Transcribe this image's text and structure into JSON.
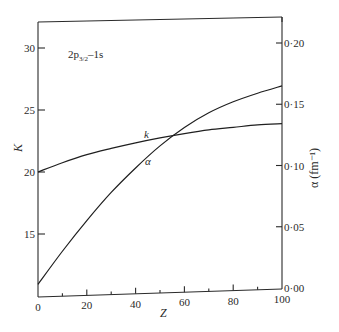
{
  "chart_data": {
    "type": "line",
    "title": "",
    "annotation": "2p3/2–1s",
    "annotation_main": "2p",
    "annotation_sub": "3/2",
    "annotation_tail": "–1s",
    "xlabel": "Z",
    "ylabel_left": "K",
    "ylabel_right": "α (fm⁻¹)",
    "xlim": [
      0,
      100
    ],
    "ylim_left": [
      10.9,
      32
    ],
    "ylim_right": [
      0.0,
      0.215
    ],
    "x_ticks": [
      0,
      20,
      40,
      60,
      80,
      100
    ],
    "x_tick_labels": [
      "0",
      "20",
      "40",
      "60",
      "80",
      "100"
    ],
    "x_minor_ticks": [
      10,
      30,
      50,
      70,
      90
    ],
    "y_left_ticks": [
      15,
      20,
      25,
      30
    ],
    "y_left_tick_labels": [
      "15",
      "20",
      "25",
      "30"
    ],
    "y_right_ticks": [
      0.0,
      0.05,
      0.1,
      0.15,
      0.2
    ],
    "y_right_tick_labels": [
      "0·00",
      "0·05",
      "0·10",
      "0·15",
      "0·20"
    ],
    "grid": false,
    "series": [
      {
        "name": "k",
        "axis": "left",
        "x": [
          0,
          10,
          20,
          30,
          40,
          50,
          60,
          70,
          80,
          90,
          100
        ],
        "values": [
          20.0,
          20.75,
          21.4,
          21.9,
          22.35,
          22.75,
          23.1,
          23.4,
          23.6,
          23.8,
          23.9
        ]
      },
      {
        "name": "α",
        "axis": "right",
        "x": [
          0,
          10,
          20,
          30,
          40,
          50,
          60,
          70,
          80,
          90,
          100
        ],
        "values": [
          0.003,
          0.03,
          0.055,
          0.078,
          0.098,
          0.116,
          0.131,
          0.143,
          0.152,
          0.159,
          0.165
        ]
      }
    ]
  }
}
